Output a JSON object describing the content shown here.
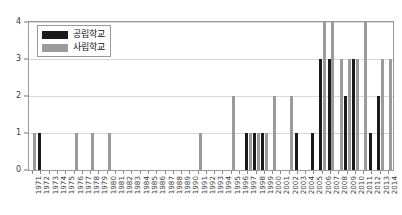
{
  "chart_data": {
    "type": "bar",
    "title": "",
    "subtitle": "",
    "xlabel": "",
    "ylabel": "",
    "ylim": [
      0,
      4
    ],
    "yticks": [
      0,
      1,
      2,
      3,
      4
    ],
    "ytick_labels": [
      "0",
      "1",
      "2",
      "3",
      "4"
    ],
    "grid": true,
    "legend_position": "upper-left",
    "orientation": "vertical",
    "bar_mode": "grouped",
    "categories": [
      "1971",
      "1972",
      "1973",
      "1974",
      "1975",
      "1976",
      "1977",
      "1978",
      "1979",
      "1980",
      "1981",
      "1982",
      "1983",
      "1984",
      "1985",
      "1986",
      "1987",
      "1988",
      "1989",
      "1990",
      "1991",
      "1992",
      "1993",
      "1994",
      "1995",
      "1996",
      "1997",
      "1998",
      "1999",
      "2000",
      "2001",
      "2002",
      "2003",
      "2004",
      "2005",
      "2006",
      "2007",
      "2008",
      "2009",
      "2010",
      "2011",
      "2012",
      "2013",
      "2014"
    ],
    "series": [
      {
        "name": "공립학교",
        "color": "#1b1b1b",
        "values": [
          0,
          1,
          0,
          0,
          0,
          0,
          0,
          0,
          0,
          0,
          0,
          0,
          0,
          0,
          0,
          0,
          0,
          0,
          0,
          0,
          0,
          0,
          0,
          0,
          0,
          0,
          1,
          1,
          1,
          0,
          0,
          0,
          1,
          0,
          1,
          3,
          3,
          0,
          2,
          3,
          0,
          1,
          2,
          0
        ]
      },
      {
        "name": "사립학교",
        "color": "#9b9b9b",
        "values": [
          1,
          0,
          0,
          0,
          0,
          1,
          0,
          1,
          0,
          1,
          0,
          0,
          0,
          0,
          0,
          0,
          0,
          0,
          0,
          0,
          1,
          0,
          0,
          0,
          2,
          0,
          1,
          1,
          1,
          2,
          0,
          2,
          0,
          0,
          0,
          4,
          4,
          3,
          3,
          3,
          4,
          0,
          3,
          3
        ]
      }
    ]
  },
  "legend": {
    "entries": [
      {
        "label": "공립학교",
        "swatch": "black-swatch"
      },
      {
        "label": "사립학교",
        "swatch": "gray-swatch"
      }
    ]
  }
}
